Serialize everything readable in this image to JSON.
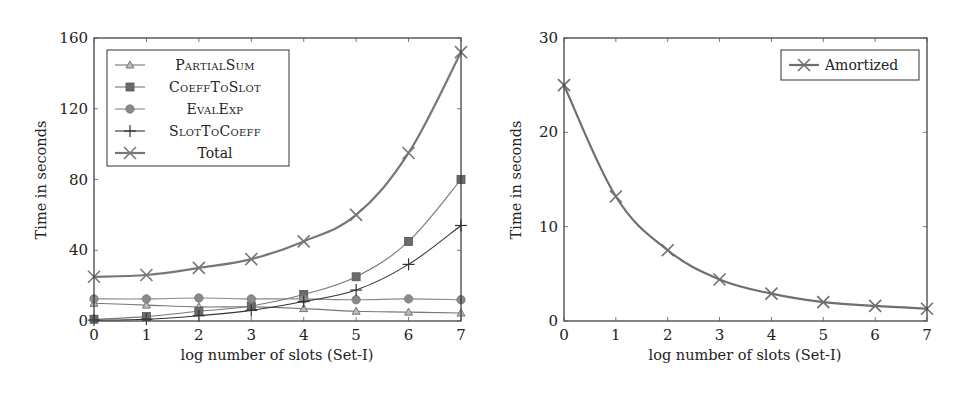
{
  "colors": {
    "axis": "#333333",
    "partialsum": "#777777",
    "coefftoslot": "#777777",
    "evalexp": "#888888",
    "slottocoeff": "#333333",
    "total": "#777777",
    "amortized": "#6f6f6f"
  },
  "chart_data": [
    {
      "type": "line",
      "title": "",
      "xlabel": "log number of slots (Set-I)",
      "ylabel": "Time in seconds",
      "x": [
        0,
        1,
        2,
        3,
        4,
        5,
        6,
        7
      ],
      "xticks": [
        "0",
        "1",
        "2",
        "3",
        "4",
        "5",
        "6",
        "7"
      ],
      "yticks": [
        "0",
        "40",
        "80",
        "120",
        "160"
      ],
      "xlim": [
        0,
        7
      ],
      "ylim": [
        0,
        160
      ],
      "grid": false,
      "legend_position": "upper left",
      "series": [
        {
          "name": "PartialSum",
          "marker": "triangle",
          "values": [
            10,
            9,
            8,
            8,
            7,
            5.5,
            5,
            4.5
          ]
        },
        {
          "name": "CoeffToSlot",
          "marker": "square",
          "values": [
            1,
            2.5,
            5.5,
            8.5,
            15,
            25,
            45,
            80
          ]
        },
        {
          "name": "EvalExp",
          "marker": "circle",
          "values": [
            12.5,
            12.5,
            13,
            12.5,
            12.5,
            12,
            12.5,
            12
          ]
        },
        {
          "name": "SlotToCoeff",
          "marker": "plus",
          "values": [
            0.5,
            1,
            3,
            6,
            11,
            17.5,
            32,
            54
          ]
        },
        {
          "name": "Total",
          "marker": "x",
          "values": [
            25,
            26,
            30,
            35,
            45,
            60,
            95,
            152
          ]
        }
      ]
    },
    {
      "type": "line",
      "title": "",
      "xlabel": "log number of slots (Set-I)",
      "ylabel": "Time in seconds",
      "x": [
        0,
        1,
        2,
        3,
        4,
        5,
        6,
        7
      ],
      "xticks": [
        "0",
        "1",
        "2",
        "3",
        "4",
        "5",
        "6",
        "7"
      ],
      "yticks": [
        "0",
        "10",
        "20",
        "30"
      ],
      "xlim": [
        0,
        7
      ],
      "ylim": [
        0,
        30
      ],
      "grid": false,
      "legend_position": "upper right",
      "series": [
        {
          "name": "Amortized",
          "marker": "x",
          "values": [
            25,
            13.2,
            7.5,
            4.4,
            2.9,
            2.0,
            1.6,
            1.3
          ]
        }
      ]
    }
  ],
  "legend_left": {
    "items": [
      "PartialSum",
      "CoeffToSlot",
      "EvalExp",
      "SlotToCoeff",
      "Total"
    ]
  },
  "legend_right": {
    "items": [
      "Amortized"
    ]
  }
}
